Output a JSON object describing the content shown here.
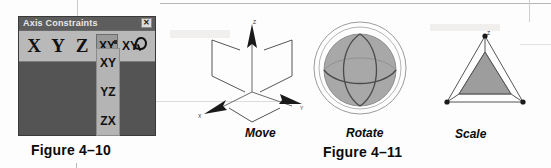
{
  "dialog": {
    "title": "Axis Constraints",
    "close_label": "✕",
    "close_icon": "close-icon",
    "axis_buttons": [
      {
        "label": "X",
        "name": "axis-button-x"
      },
      {
        "label": "Y",
        "name": "axis-button-y"
      },
      {
        "label": "Z",
        "name": "axis-button-z"
      }
    ],
    "active_plane_button": "XY",
    "flyout_button": "XY",
    "flyout_items": [
      {
        "label": "XY"
      },
      {
        "label": "YZ"
      },
      {
        "label": "ZX"
      }
    ],
    "colors": {
      "body": "#545454",
      "titlebar": "#5d5d5d",
      "toolbar": "#b9b9b9",
      "active_button": "#9a9a9a",
      "flyout": "#b4b4b4"
    }
  },
  "figures": {
    "fig_410_caption": "Figure 4–10",
    "fig_411_caption": "Figure 4–11"
  },
  "gizmos": [
    {
      "name": "move",
      "label": "Move",
      "axis_labels": {
        "z": "Z",
        "x": "X",
        "y": "Y"
      }
    },
    {
      "name": "rotate",
      "label": "Rotate",
      "fill": "#a8a8a8"
    },
    {
      "name": "scale",
      "label": "Scale",
      "fill": "#9d9d9d"
    }
  ]
}
